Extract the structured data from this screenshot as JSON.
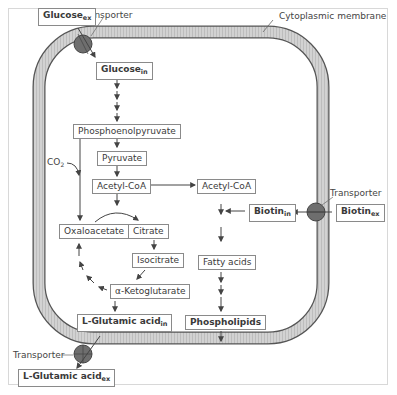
{
  "diagram": {
    "membrane_label": "Cytoplasmic membrane",
    "transporter_label": "Transporter",
    "colors": {
      "membrane_fill": "#c8c8c8",
      "membrane_edge": "#555555",
      "transporter_fill": "#6e6e6e",
      "arrow": "#444444",
      "box_border": "#8a8a8a"
    },
    "nodes": {
      "glucose_ex": {
        "base": "Glucose",
        "sub": "ex"
      },
      "glucose_in": {
        "base": "Glucose",
        "sub": "in"
      },
      "pep": {
        "text": "Phosphoenolpyruvate"
      },
      "pyruvate": {
        "text": "Pyruvate"
      },
      "acetyl_coa_1": {
        "text": "Acetyl-CoA"
      },
      "acetyl_coa_2": {
        "text": "Acetyl-CoA"
      },
      "oxaloacetate": {
        "text": "Oxaloacetate"
      },
      "citrate": {
        "text": "Citrate"
      },
      "isocitrate": {
        "text": "Isocitrate"
      },
      "akg": {
        "text": "α-Ketoglutarate"
      },
      "glutamic_in": {
        "base": "L-Glutamic acid",
        "sub": "in"
      },
      "glutamic_ex": {
        "base": "L-Glutamic acid",
        "sub": "ex"
      },
      "biotin_in": {
        "base": "Biotin",
        "sub": "in"
      },
      "biotin_ex": {
        "base": "Biotin",
        "sub": "ex"
      },
      "fatty_acids": {
        "text": "Fatty acids"
      },
      "phospholipids": {
        "text": "Phospholipids"
      }
    },
    "co2": {
      "base": "CO",
      "sub": "2"
    }
  }
}
